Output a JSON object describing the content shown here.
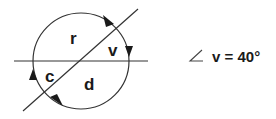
{
  "diagram": {
    "type": "intersecting-lines-in-circle",
    "labels": {
      "top": "r",
      "right": "v",
      "left": "c",
      "bottom": "d"
    },
    "equation": {
      "angle_symbol": "∠",
      "variable": "v",
      "equals": "=",
      "value": "40°",
      "text": "v = 40°"
    },
    "arrows": [
      "top-right clockwise",
      "right downward",
      "left upward",
      "bottom-left"
    ],
    "colors": {
      "stroke": "#333333",
      "text": "#1a1a1a",
      "background": "#ffffff"
    }
  }
}
